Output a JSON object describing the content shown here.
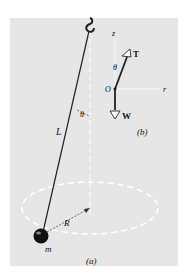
{
  "figure": {
    "panel_a": {
      "caption": "(a)",
      "labels": {
        "length": "L",
        "angle": "θ",
        "radius": "R",
        "mass": "m"
      },
      "elements": [
        "hook",
        "string",
        "vertical-axis",
        "circular-path",
        "ball"
      ]
    },
    "panel_b": {
      "caption": "(b)",
      "labels": {
        "z_axis": "z",
        "r_axis": "r",
        "origin": "O",
        "angle": "θ",
        "tension": "T",
        "weight": "W"
      },
      "elements": [
        "z-axis",
        "r-axis",
        "tension-vector",
        "weight-vector"
      ]
    },
    "colors": {
      "background": "#ffffff",
      "panel": "#e6e6e6",
      "ink": "#111111",
      "dashed": "#ffffff"
    }
  }
}
